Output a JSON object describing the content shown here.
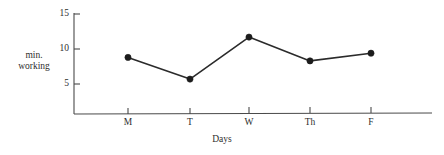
{
  "chart_data": {
    "type": "line",
    "title": "",
    "subtitle": "",
    "xlabel": "Days",
    "ylabel": "min. working",
    "ylabel_line1": "min.",
    "ylabel_line2": "working",
    "categories": [
      "M",
      "T",
      "W",
      "Th",
      "F"
    ],
    "values": [
      8.8,
      5.7,
      11.7,
      8.3,
      9.4
    ],
    "series": [
      {
        "name": "min. working",
        "values": [
          8.8,
          5.7,
          11.7,
          8.3,
          9.4
        ]
      }
    ],
    "ylim": [
      0,
      15
    ],
    "yticks": [
      5,
      10,
      15
    ],
    "ytick_labels": [
      "5",
      "10",
      "15"
    ],
    "xtick_labels": [
      "M",
      "T",
      "W",
      "Th",
      "F"
    ],
    "grid": false,
    "legend": false,
    "legend_position": "none",
    "marker": "filled-circle",
    "line_color": "#2b2b2b",
    "marker_color": "#1c1c1c",
    "axis_color": "#4a4a4a",
    "background_color": "#ffffff"
  },
  "geometry": {
    "axis_x": 74,
    "axis_baseline_y": 114,
    "axis_right_x": 432,
    "axis_top_y": 13,
    "unit_px": 7,
    "zero_y": 119,
    "xpositions": [
      128,
      190,
      249,
      310,
      371
    ]
  }
}
